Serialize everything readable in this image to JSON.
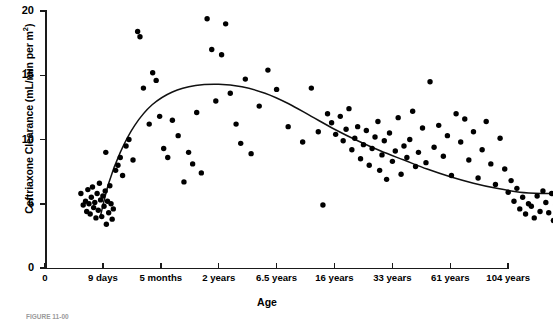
{
  "chart_data": {
    "type": "scatter",
    "title": "",
    "xlabel": "Age",
    "ylabel": "Ceftriaxone Clearance (mL/min per m²)",
    "ylabel_text": "Ceftriaxone Clearance (mL/min per m",
    "ylabel_sup": "2",
    "ylabel_tail": ")",
    "grid": false,
    "legend": "none",
    "ylim": [
      0,
      20
    ],
    "yticks": [
      0,
      5,
      10,
      15,
      20
    ],
    "ytick_labels": [
      "0",
      "5",
      "10",
      "15",
      "20"
    ],
    "xtick_labels": [
      "0",
      "9 days",
      "5 months",
      "2 years",
      "6.5 years",
      "16 years",
      "33 years",
      "61 years",
      "104 years"
    ],
    "xtick_index": [
      0,
      1,
      2,
      3,
      4,
      5,
      6,
      7,
      8
    ],
    "x_axis_note": "ordinal age categories, evenly spaced",
    "points": [
      [
        0.62,
        5.8
      ],
      [
        0.66,
        4.9
      ],
      [
        0.7,
        5.2
      ],
      [
        0.72,
        4.4
      ],
      [
        0.74,
        6.1
      ],
      [
        0.76,
        5.0
      ],
      [
        0.78,
        4.2
      ],
      [
        0.8,
        5.5
      ],
      [
        0.82,
        6.3
      ],
      [
        0.84,
        4.7
      ],
      [
        0.86,
        5.1
      ],
      [
        0.88,
        3.9
      ],
      [
        0.9,
        5.8
      ],
      [
        0.92,
        4.5
      ],
      [
        0.94,
        6.6
      ],
      [
        0.96,
        5.3
      ],
      [
        0.98,
        4.0
      ],
      [
        1.0,
        5.6
      ],
      [
        1.02,
        4.8
      ],
      [
        1.04,
        6.0
      ],
      [
        1.06,
        3.4
      ],
      [
        1.08,
        5.2
      ],
      [
        1.1,
        4.3
      ],
      [
        1.12,
        6.4
      ],
      [
        1.14,
        5.0
      ],
      [
        1.16,
        3.8
      ],
      [
        1.18,
        4.6
      ],
      [
        1.22,
        7.6
      ],
      [
        1.26,
        8.0
      ],
      [
        1.3,
        8.6
      ],
      [
        1.05,
        9.0
      ],
      [
        1.34,
        7.2
      ],
      [
        1.4,
        9.5
      ],
      [
        1.45,
        10.0
      ],
      [
        1.52,
        8.4
      ],
      [
        1.6,
        18.4
      ],
      [
        1.64,
        18.0
      ],
      [
        1.7,
        14.0
      ],
      [
        1.8,
        11.2
      ],
      [
        1.86,
        15.2
      ],
      [
        1.92,
        14.6
      ],
      [
        1.98,
        11.8
      ],
      [
        2.05,
        9.3
      ],
      [
        2.12,
        8.6
      ],
      [
        2.2,
        11.5
      ],
      [
        2.3,
        10.3
      ],
      [
        2.4,
        6.7
      ],
      [
        2.48,
        9.0
      ],
      [
        2.55,
        8.1
      ],
      [
        2.62,
        12.1
      ],
      [
        2.7,
        7.4
      ],
      [
        2.8,
        19.4
      ],
      [
        2.88,
        17.0
      ],
      [
        2.95,
        13.0
      ],
      [
        3.05,
        16.6
      ],
      [
        3.12,
        19.0
      ],
      [
        3.2,
        13.6
      ],
      [
        3.3,
        11.2
      ],
      [
        3.38,
        9.7
      ],
      [
        3.46,
        14.7
      ],
      [
        3.56,
        8.9
      ],
      [
        3.7,
        12.6
      ],
      [
        3.85,
        15.4
      ],
      [
        4.0,
        13.9
      ],
      [
        4.2,
        11.0
      ],
      [
        4.45,
        9.8
      ],
      [
        4.6,
        14.0
      ],
      [
        4.72,
        10.6
      ],
      [
        4.8,
        4.9
      ],
      [
        4.88,
        12.0
      ],
      [
        4.95,
        11.3
      ],
      [
        5.02,
        10.4
      ],
      [
        5.1,
        11.8
      ],
      [
        5.15,
        9.9
      ],
      [
        5.2,
        10.8
      ],
      [
        5.25,
        12.4
      ],
      [
        5.3,
        9.2
      ],
      [
        5.35,
        10.1
      ],
      [
        5.4,
        11.0
      ],
      [
        5.45,
        8.5
      ],
      [
        5.5,
        9.6
      ],
      [
        5.55,
        10.7
      ],
      [
        5.6,
        8.0
      ],
      [
        5.65,
        9.3
      ],
      [
        5.7,
        10.2
      ],
      [
        5.75,
        11.4
      ],
      [
        5.78,
        7.6
      ],
      [
        5.82,
        8.8
      ],
      [
        5.86,
        9.9
      ],
      [
        5.9,
        6.9
      ],
      [
        5.95,
        10.5
      ],
      [
        6.0,
        8.3
      ],
      [
        6.05,
        9.1
      ],
      [
        6.1,
        11.7
      ],
      [
        6.15,
        7.3
      ],
      [
        6.2,
        9.5
      ],
      [
        6.25,
        8.6
      ],
      [
        6.3,
        10.0
      ],
      [
        6.35,
        12.2
      ],
      [
        6.4,
        7.9
      ],
      [
        6.45,
        9.0
      ],
      [
        6.52,
        10.9
      ],
      [
        6.58,
        8.2
      ],
      [
        6.65,
        14.5
      ],
      [
        6.72,
        9.4
      ],
      [
        6.8,
        11.1
      ],
      [
        6.88,
        8.7
      ],
      [
        6.95,
        10.3
      ],
      [
        7.02,
        7.2
      ],
      [
        7.1,
        12.0
      ],
      [
        7.18,
        9.8
      ],
      [
        7.25,
        11.6
      ],
      [
        7.32,
        8.4
      ],
      [
        7.4,
        10.6
      ],
      [
        7.48,
        7.0
      ],
      [
        7.55,
        9.2
      ],
      [
        7.62,
        11.4
      ],
      [
        7.7,
        8.1
      ],
      [
        7.78,
        6.5
      ],
      [
        7.86,
        10.1
      ],
      [
        7.94,
        7.7
      ],
      [
        8.0,
        5.9
      ],
      [
        8.05,
        6.8
      ],
      [
        8.1,
        5.2
      ],
      [
        8.15,
        6.2
      ],
      [
        8.2,
        4.6
      ],
      [
        8.25,
        5.5
      ],
      [
        8.3,
        4.2
      ],
      [
        8.35,
        5.0
      ],
      [
        8.4,
        4.8
      ],
      [
        8.45,
        3.9
      ],
      [
        8.5,
        5.6
      ],
      [
        8.55,
        4.4
      ],
      [
        8.6,
        6.0
      ],
      [
        8.65,
        5.1
      ],
      [
        8.7,
        4.3
      ],
      [
        8.75,
        5.8
      ],
      [
        8.78,
        3.7
      ],
      [
        8.82,
        4.9
      ]
    ],
    "fit_curve_note": "smooth fitted regression curve, peaks ~14.3 at 2 years, declines to ~5.8 at 104 years",
    "fit_curve": [
      [
        0.95,
        3.9
      ],
      [
        1.1,
        6.6
      ],
      [
        1.3,
        9.0
      ],
      [
        1.55,
        11.1
      ],
      [
        1.85,
        12.7
      ],
      [
        2.2,
        13.7
      ],
      [
        2.6,
        14.2
      ],
      [
        3.0,
        14.3
      ],
      [
        3.4,
        14.1
      ],
      [
        3.8,
        13.6
      ],
      [
        4.2,
        12.8
      ],
      [
        4.6,
        11.8
      ],
      [
        5.0,
        10.8
      ],
      [
        5.4,
        9.9
      ],
      [
        5.8,
        9.1
      ],
      [
        6.2,
        8.4
      ],
      [
        6.6,
        7.7
      ],
      [
        7.0,
        7.1
      ],
      [
        7.4,
        6.6
      ],
      [
        7.8,
        6.2
      ],
      [
        8.2,
        5.9
      ],
      [
        8.6,
        5.8
      ],
      [
        8.9,
        5.8
      ]
    ]
  },
  "caption": {
    "text": "FIGURE 11-00"
  }
}
